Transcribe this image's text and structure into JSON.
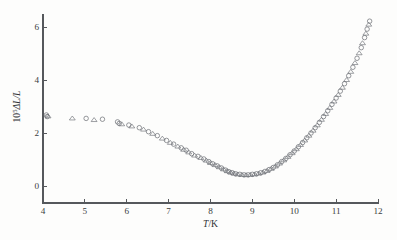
{
  "figure": {
    "title": "",
    "background_color": "#fdfdfc",
    "axis_color": "#55585c",
    "marker_color": "#6c7075"
  },
  "axes": {
    "x_label_prefix": "T",
    "x_label_suffix": "/K",
    "x_label_full": "T/K",
    "y_label_coefficient": "10",
    "y_label_exponent": "5",
    "y_label_delta": "ΔL/L",
    "y_label_full": "10⁵ΔL/L",
    "x_ticks": [
      "4",
      "5",
      "6",
      "7",
      "8",
      "9",
      "10",
      "11",
      "12"
    ],
    "y_ticks": [
      "0",
      "2",
      "4",
      "6"
    ]
  },
  "chart_data": {
    "type": "scatter",
    "title": "",
    "xlabel": "T/K",
    "ylabel": "10^5 ΔL/L",
    "xlim": [
      4,
      12
    ],
    "ylim": [
      -0.65,
      6.6
    ],
    "x_tick_values": [
      4,
      5,
      6,
      7,
      8,
      9,
      10,
      11,
      12
    ],
    "y_tick_values": [
      0,
      2,
      4,
      6
    ],
    "grid": false,
    "legend_position": "none",
    "series": [
      {
        "name": "sample-1-circles",
        "marker": "circle",
        "points": [
          [
            4.08,
            2.68
          ],
          [
            4.1,
            2.62
          ],
          [
            5.03,
            2.55
          ],
          [
            5.42,
            2.52
          ],
          [
            5.78,
            2.42
          ],
          [
            5.82,
            2.36
          ],
          [
            6.05,
            2.3
          ],
          [
            6.3,
            2.2
          ],
          [
            6.52,
            2.05
          ],
          [
            6.73,
            1.9
          ],
          [
            6.95,
            1.72
          ],
          [
            7.12,
            1.58
          ],
          [
            7.3,
            1.44
          ],
          [
            7.42,
            1.35
          ],
          [
            7.55,
            1.22
          ],
          [
            7.7,
            1.12
          ],
          [
            7.84,
            1.02
          ],
          [
            7.96,
            0.92
          ],
          [
            8.05,
            0.84
          ],
          [
            8.16,
            0.76
          ],
          [
            8.26,
            0.68
          ],
          [
            8.36,
            0.6
          ],
          [
            8.44,
            0.54
          ],
          [
            8.52,
            0.5
          ],
          [
            8.6,
            0.46
          ],
          [
            8.7,
            0.44
          ],
          [
            8.8,
            0.42
          ],
          [
            8.9,
            0.42
          ],
          [
            9.0,
            0.44
          ],
          [
            9.1,
            0.46
          ],
          [
            9.2,
            0.5
          ],
          [
            9.3,
            0.55
          ],
          [
            9.4,
            0.62
          ],
          [
            9.5,
            0.7
          ],
          [
            9.6,
            0.8
          ],
          [
            9.7,
            0.92
          ],
          [
            9.8,
            1.04
          ],
          [
            9.9,
            1.18
          ],
          [
            10.0,
            1.32
          ],
          [
            10.1,
            1.48
          ],
          [
            10.2,
            1.64
          ],
          [
            10.3,
            1.82
          ],
          [
            10.4,
            2.0
          ],
          [
            10.5,
            2.2
          ],
          [
            10.6,
            2.4
          ],
          [
            10.7,
            2.62
          ],
          [
            10.8,
            2.84
          ],
          [
            10.9,
            3.08
          ],
          [
            11.0,
            3.32
          ],
          [
            11.1,
            3.58
          ],
          [
            11.2,
            3.86
          ],
          [
            11.3,
            4.16
          ],
          [
            11.4,
            4.48
          ],
          [
            11.5,
            4.82
          ],
          [
            11.6,
            5.22
          ],
          [
            11.68,
            5.6
          ],
          [
            11.74,
            5.92
          ],
          [
            11.8,
            6.22
          ]
        ]
      },
      {
        "name": "sample-2-triangles",
        "marker": "triangle",
        "points": [
          [
            4.12,
            2.64
          ],
          [
            4.7,
            2.56
          ],
          [
            5.22,
            2.5
          ],
          [
            5.88,
            2.34
          ],
          [
            6.12,
            2.26
          ],
          [
            6.4,
            2.14
          ],
          [
            6.62,
            1.98
          ],
          [
            6.85,
            1.8
          ],
          [
            7.04,
            1.64
          ],
          [
            7.22,
            1.5
          ],
          [
            7.36,
            1.38
          ],
          [
            7.48,
            1.28
          ],
          [
            7.62,
            1.16
          ],
          [
            7.77,
            1.07
          ],
          [
            7.9,
            0.97
          ],
          [
            8.0,
            0.88
          ],
          [
            8.11,
            0.8
          ],
          [
            8.21,
            0.72
          ],
          [
            8.31,
            0.64
          ],
          [
            8.4,
            0.57
          ],
          [
            8.48,
            0.52
          ],
          [
            8.56,
            0.48
          ],
          [
            8.65,
            0.45
          ],
          [
            8.75,
            0.43
          ],
          [
            8.85,
            0.42
          ],
          [
            8.95,
            0.43
          ],
          [
            9.05,
            0.45
          ],
          [
            9.15,
            0.48
          ],
          [
            9.25,
            0.52
          ],
          [
            9.35,
            0.58
          ],
          [
            9.45,
            0.66
          ],
          [
            9.55,
            0.75
          ],
          [
            9.65,
            0.86
          ],
          [
            9.75,
            0.98
          ],
          [
            9.85,
            1.11
          ],
          [
            9.95,
            1.25
          ],
          [
            10.05,
            1.4
          ],
          [
            10.15,
            1.56
          ],
          [
            10.25,
            1.73
          ],
          [
            10.35,
            1.91
          ],
          [
            10.45,
            2.1
          ],
          [
            10.55,
            2.3
          ],
          [
            10.65,
            2.51
          ],
          [
            10.75,
            2.73
          ],
          [
            10.85,
            2.96
          ],
          [
            10.95,
            3.2
          ],
          [
            11.05,
            3.45
          ],
          [
            11.15,
            3.72
          ],
          [
            11.25,
            4.01
          ],
          [
            11.35,
            4.32
          ],
          [
            11.45,
            4.65
          ],
          [
            11.55,
            5.02
          ],
          [
            11.63,
            5.4
          ],
          [
            11.71,
            5.76
          ],
          [
            11.78,
            6.1
          ]
        ]
      }
    ]
  }
}
